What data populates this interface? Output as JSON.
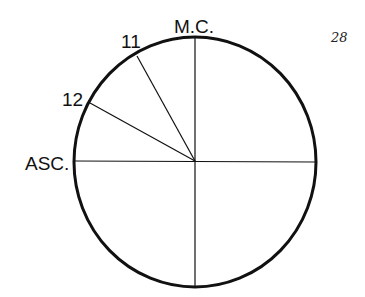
{
  "page_number": "28",
  "diagram": {
    "type": "house-chart-quadrant",
    "center": [
      195,
      161
    ],
    "radius_x": 121,
    "radius_y": 125,
    "labels": {
      "mc": "M.C.",
      "asc": "ASC.",
      "house_11": "11",
      "house_12": "12"
    },
    "spokes": [
      {
        "name": "mc-axis",
        "from": [
          195,
          37
        ],
        "to": [
          195,
          287
        ]
      },
      {
        "name": "asc-axis",
        "from": [
          74,
          161
        ],
        "to": [
          315,
          161
        ]
      },
      {
        "name": "house-11-cusp",
        "from": [
          195,
          161
        ],
        "to": [
          137,
          57
        ]
      },
      {
        "name": "house-12-cusp",
        "from": [
          195,
          161
        ],
        "to": [
          90,
          103
        ]
      }
    ],
    "colors": {
      "stroke": "#111111",
      "background": "#ffffff"
    }
  }
}
